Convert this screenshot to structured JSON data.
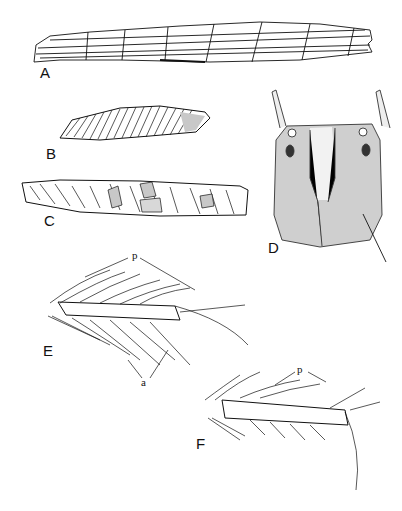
{
  "figure": {
    "panels": [
      {
        "id": "A",
        "label": "A",
        "subject": "case-long-segmented"
      },
      {
        "id": "B",
        "label": "B",
        "subject": "case-fine-fragments"
      },
      {
        "id": "C",
        "label": "C",
        "subject": "case-mixed-fragments"
      },
      {
        "id": "D",
        "label": "D",
        "subject": "head-dorsal-view"
      },
      {
        "id": "E",
        "label": "E",
        "subject": "leg-tarsus-with-setae",
        "annotations": [
          "p",
          "a"
        ]
      },
      {
        "id": "F",
        "label": "F",
        "subject": "leg-tarsus-claw",
        "annotations": [
          "p"
        ]
      }
    ],
    "annotation_E_p": "p",
    "annotation_E_a": "a",
    "annotation_F_p": "p",
    "colors": {
      "ink": "#111111",
      "shade": "#b8b8b8",
      "background": "#ffffff"
    }
  }
}
